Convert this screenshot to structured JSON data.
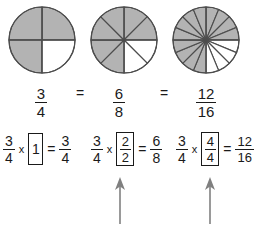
{
  "figure": {
    "colors": {
      "shaded": "#b3b3b3",
      "unshaded": "#ffffff",
      "stroke": "#4d4d4d",
      "text": "#1a1a1a",
      "arrow": "#808080"
    }
  },
  "pies": [
    {
      "name": "pie-three-fourths",
      "total_slices": 4,
      "shaded_slices": 3,
      "label": "3/4"
    },
    {
      "name": "pie-six-eighths",
      "total_slices": 8,
      "shaded_slices": 6,
      "label": "6/8"
    },
    {
      "name": "pie-twelve-sixteenths",
      "total_slices": 16,
      "shaded_slices": 12,
      "label": "12/16"
    }
  ],
  "equation_row": {
    "fraction_1": {
      "numerator": "3",
      "denominator": "4"
    },
    "operator_1": "=",
    "fraction_2": {
      "numerator": "6",
      "denominator": "8"
    },
    "operator_2": "=",
    "fraction_3": {
      "numerator": "12",
      "denominator": "16"
    }
  },
  "mult_row": [
    {
      "name": "multiply-by-one",
      "left": {
        "numerator": "3",
        "denominator": "4"
      },
      "times": "x",
      "boxed_whole": "1",
      "equals": "=",
      "result": {
        "numerator": "3",
        "denominator": "4"
      }
    },
    {
      "name": "multiply-by-two-halves",
      "left": {
        "numerator": "3",
        "denominator": "4"
      },
      "times": "x",
      "boxed_fraction": {
        "numerator": "2",
        "denominator": "2"
      },
      "equals": "=",
      "result": {
        "numerator": "6",
        "denominator": "8"
      }
    },
    {
      "name": "multiply-by-four-fourths",
      "left": {
        "numerator": "3",
        "denominator": "4"
      },
      "times": "x",
      "boxed_fraction": {
        "numerator": "4",
        "denominator": "4"
      },
      "equals": "=",
      "result": {
        "numerator": "12",
        "denominator": "16"
      }
    }
  ],
  "arrows": [
    {
      "name": "arrow-to-two-halves",
      "direction": "up"
    },
    {
      "name": "arrow-to-four-fourths",
      "direction": "up"
    }
  ]
}
